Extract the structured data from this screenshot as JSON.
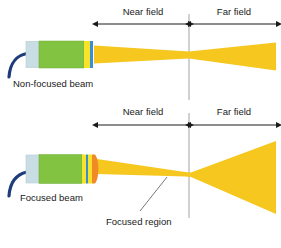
{
  "figure": {
    "background_color": "#ffffff"
  },
  "colors": {
    "beam": "#F5C71F",
    "beam_light": "#F7CE3A",
    "probe_body": "#C9DEE4",
    "probe_green": "#82C341",
    "probe_yellow": "#F7E32A",
    "probe_blue_strip": "#3A8FD0",
    "probe_lens_orange": "#F08A26",
    "probe_outline": "#9FB9C0",
    "cable": "#1F3C7A",
    "arrow": "#1a1a1a",
    "divider": "#8a8a8a",
    "leader": "#555555",
    "text": "#1a1a1a"
  },
  "panels": [
    {
      "id": "non-focused",
      "beam_label": "Non-focused beam",
      "near_field_label": "Near field",
      "far_field_label": "Far field"
    },
    {
      "id": "focused",
      "beam_label": "Focused beam",
      "near_field_label": "Near field",
      "far_field_label": "Far field",
      "annotation_label": "Focused region"
    }
  ],
  "top": {
    "near_field_label": "Near field",
    "far_field_label": "Far field",
    "beam_label": "Non-focused beam"
  },
  "bottom": {
    "near_field_label": "Near field",
    "far_field_label": "Far field",
    "beam_label": "Focused beam",
    "annotation_label": "Focused region"
  }
}
